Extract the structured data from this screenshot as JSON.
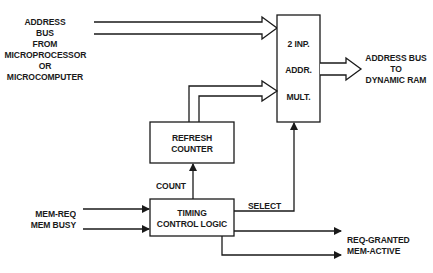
{
  "diagram": {
    "type": "block-diagram",
    "colors": {
      "line": "#1a1a1a",
      "background": "#ffffff"
    },
    "inputs": {
      "address_bus_from": [
        "ADDRESS",
        "BUS",
        "FROM",
        "MICROPROCESSOR",
        "OR",
        "MICROCOMPUTER"
      ],
      "mem_req": "MEM-REQ",
      "mem_busy": "MEM BUSY"
    },
    "blocks": {
      "multiplexer": {
        "lines": [
          "2 INP.",
          "ADDR.",
          "MULT."
        ]
      },
      "refresh_counter": {
        "lines": [
          "REFRESH",
          "COUNTER"
        ]
      },
      "timing_control": {
        "lines": [
          "TIMING",
          "CONTROL LOGIC"
        ]
      }
    },
    "signals": {
      "count": "COUNT",
      "select": "SELECT"
    },
    "outputs": {
      "address_bus_to": [
        "ADDRESS BUS",
        "TO",
        "DYNAMIC RAM"
      ],
      "req_granted": "REQ-GRANTED",
      "mem_active": "MEM-ACTIVE"
    }
  }
}
